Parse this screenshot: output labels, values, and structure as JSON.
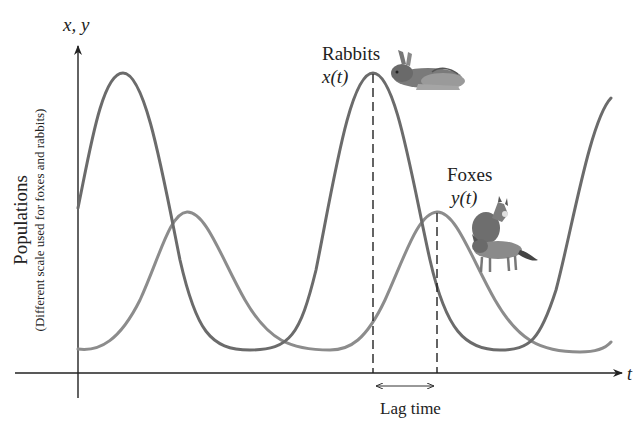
{
  "diagram": {
    "axes": {
      "y_label": "x, y",
      "x_label": "t",
      "y_title": "Populations",
      "y_subtitle": "(Different scale used for foxes and rabbits)"
    },
    "series": [
      {
        "name": "Rabbits",
        "function": "x(t)",
        "color": "#6b6b6b",
        "icon": "rabbit-icon"
      },
      {
        "name": "Foxes",
        "function": "y(t)",
        "color": "#8c8c8c",
        "icon": "fox-icon"
      }
    ],
    "annotation": {
      "lag_label": "Lag time"
    },
    "colors": {
      "axis": "#222222",
      "rabbits_curve": "#6b6b6b",
      "foxes_curve": "#8c8c8c",
      "dashed_line": "#222222",
      "background": "#ffffff"
    }
  }
}
